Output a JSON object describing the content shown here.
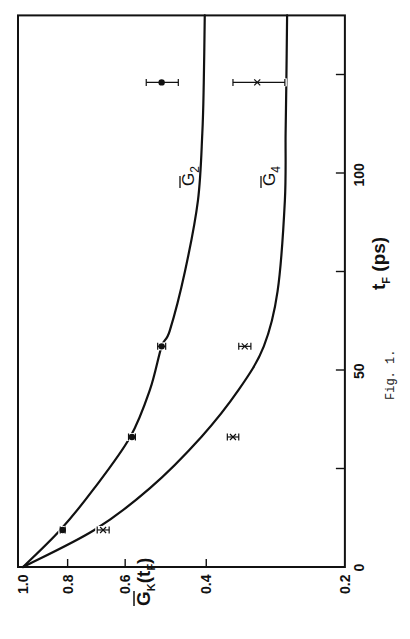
{
  "caption": "Fig. 1.",
  "chart_data": {
    "type": "line",
    "orientation_note": "figure printed rotated 90 degrees counter-clockwise",
    "title": "",
    "xlabel": "t_F (ps)",
    "ylabel": "Ḡ_K(t_F)",
    "xlim": [
      0,
      140
    ],
    "ylim": [
      0.2,
      1.0
    ],
    "yscale": "log",
    "x_ticks": [
      0,
      25,
      50,
      75,
      100,
      125
    ],
    "x_tick_labels": [
      "0",
      "",
      "50",
      "",
      "100",
      ""
    ],
    "y_ticks": [
      1.0,
      0.8,
      0.6,
      0.4,
      0.2
    ],
    "y_tick_labels": [
      "1.0",
      "0.8",
      "0.6",
      "0.4",
      "0.2"
    ],
    "grid": false,
    "series": [
      {
        "name": "Ḡ2",
        "label_main": "G",
        "label_sub": "2",
        "kind": "theory-curve",
        "x": [
          0,
          9.4,
          20,
          33,
          45,
          56,
          60,
          75,
          93,
          110,
          123,
          140
        ],
        "values": [
          1.0,
          0.83,
          0.7,
          0.585,
          0.53,
          0.5,
          0.48,
          0.445,
          0.417,
          0.408,
          0.405,
          0.403
        ]
      },
      {
        "name": "Ḡ4",
        "label_main": "G",
        "label_sub": "4",
        "kind": "theory-curve",
        "x": [
          0,
          9.4,
          20,
          33,
          45,
          56,
          70,
          93,
          110,
          123,
          140
        ],
        "values": [
          1.0,
          0.7,
          0.53,
          0.41,
          0.34,
          0.3,
          0.28,
          0.27,
          0.269,
          0.268,
          0.267
        ]
      },
      {
        "name": "G2 measured",
        "kind": "data-points",
        "marker": "dot",
        "x": [
          9.4,
          33,
          56,
          123
        ],
        "values": [
          0.82,
          0.58,
          0.5,
          0.5
        ],
        "errors": [
          0.01,
          0.01,
          0.01,
          0.04
        ]
      },
      {
        "name": "G4 measured",
        "kind": "data-points",
        "marker": "x",
        "x": [
          9.4,
          33,
          56,
          123
        ],
        "values": [
          0.67,
          0.35,
          0.33,
          0.31
        ],
        "errors": [
          0.02,
          0.01,
          0.01,
          0.04
        ]
      }
    ],
    "legend": "none (curves labeled inline Ḡ2, Ḡ4)"
  }
}
